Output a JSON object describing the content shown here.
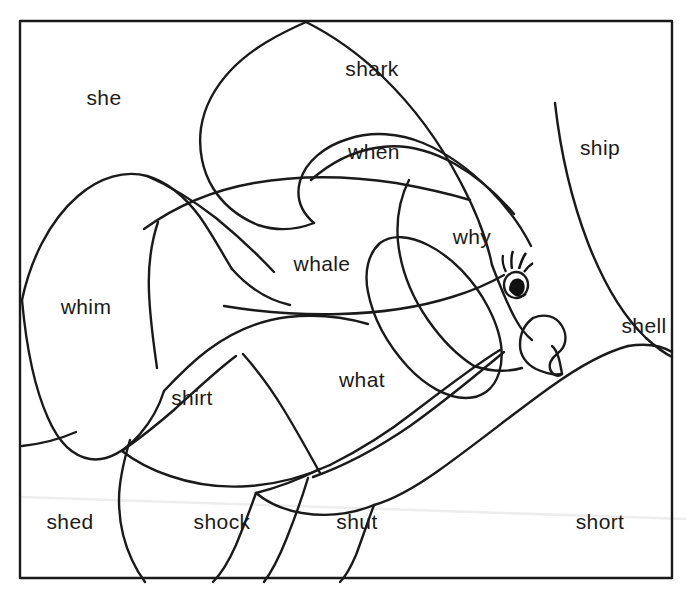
{
  "page": {
    "kind": "coloring-worksheet",
    "background_color": "#ffffff",
    "ink_color": "#1a1a1a",
    "scan_line_color": "#eaeaea"
  },
  "frame": {
    "x": 20,
    "y": 21,
    "width": 652,
    "height": 557,
    "stroke_color": "#1a1a1a",
    "stroke_width": 2.4
  },
  "subject": {
    "name": "fish",
    "description": "Outline drawing of a fish facing right with fins, tail and an eye with eyelashes",
    "eye": {
      "center_x": 516,
      "center_y": 283,
      "pupil_color": "#111111",
      "lash_count": 3
    }
  },
  "labels": [
    {
      "text": "she",
      "x": 104,
      "y": 97,
      "region": "upper-left-background"
    },
    {
      "text": "shark",
      "x": 372,
      "y": 68,
      "region": "top-fin"
    },
    {
      "text": "ship",
      "x": 600,
      "y": 147,
      "region": "upper-right-background"
    },
    {
      "text": "when",
      "x": 374,
      "y": 151,
      "region": "dorsal-fin"
    },
    {
      "text": "why",
      "x": 472,
      "y": 236,
      "region": "head"
    },
    {
      "text": "whale",
      "x": 322,
      "y": 263,
      "region": "upper-body"
    },
    {
      "text": "whim",
      "x": 86,
      "y": 306,
      "region": "tail"
    },
    {
      "text": "shell",
      "x": 644,
      "y": 325,
      "region": "right-background"
    },
    {
      "text": "what",
      "x": 362,
      "y": 379,
      "region": "lower-body"
    },
    {
      "text": "shirt",
      "x": 192,
      "y": 397,
      "region": "pelvic-fin"
    },
    {
      "text": "shed",
      "x": 70,
      "y": 521,
      "region": "bottom-left-background"
    },
    {
      "text": "shock",
      "x": 222,
      "y": 521,
      "region": "bottom-center-background"
    },
    {
      "text": "shut",
      "x": 357,
      "y": 521,
      "region": "bottom-center-right-background"
    },
    {
      "text": "short",
      "x": 600,
      "y": 521,
      "region": "bottom-right-background"
    }
  ],
  "word_list": [
    "she",
    "shark",
    "ship",
    "when",
    "why",
    "whale",
    "whim",
    "shell",
    "what",
    "shirt",
    "shed",
    "shock",
    "shut",
    "short"
  ]
}
